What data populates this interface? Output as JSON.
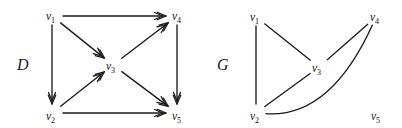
{
  "figure": {
    "width": 402,
    "height": 128,
    "background": "#ffffff",
    "ink_color": "#1a1a1a"
  },
  "graphs": [
    {
      "id": "D",
      "name_label": "D",
      "kind": "directed",
      "name_pos": {
        "x": 17,
        "y": 70
      },
      "vertices": [
        {
          "id": "v1",
          "base": "v",
          "sub": "1",
          "label": "v1",
          "label_x": 46,
          "label_y": 20,
          "node_x": 52,
          "node_y": 16
        },
        {
          "id": "v2",
          "base": "v",
          "sub": "2",
          "label": "v2",
          "label_x": 46,
          "label_y": 120,
          "node_x": 52,
          "node_y": 113
        },
        {
          "id": "v3",
          "base": "v",
          "sub": "3",
          "label": "v3",
          "label_x": 106,
          "label_y": 70,
          "node_x": 113,
          "node_y": 65
        },
        {
          "id": "v4",
          "base": "v",
          "sub": "4",
          "label": "v4",
          "label_x": 172,
          "label_y": 20,
          "node_x": 177,
          "node_y": 16
        },
        {
          "id": "v5",
          "base": "v",
          "sub": "5",
          "label": "v5",
          "label_x": 172,
          "label_y": 120,
          "node_x": 177,
          "node_y": 113
        }
      ],
      "edges": [
        {
          "from": "v1",
          "to": "v4",
          "directed": true,
          "shape": "line"
        },
        {
          "from": "v1",
          "to": "v2",
          "directed": true,
          "shape": "line"
        },
        {
          "from": "v1",
          "to": "v3",
          "directed": true,
          "shape": "line"
        },
        {
          "from": "v2",
          "to": "v3",
          "directed": true,
          "shape": "line"
        },
        {
          "from": "v2",
          "to": "v5",
          "directed": true,
          "shape": "line"
        },
        {
          "from": "v3",
          "to": "v4",
          "directed": true,
          "shape": "line"
        },
        {
          "from": "v3",
          "to": "v5",
          "directed": true,
          "shape": "line"
        },
        {
          "from": "v4",
          "to": "v5",
          "directed": true,
          "shape": "line"
        }
      ]
    },
    {
      "id": "G",
      "name_label": "G",
      "kind": "undirected",
      "name_pos": {
        "x": 217,
        "y": 70
      },
      "vertices": [
        {
          "id": "v1",
          "base": "v",
          "sub": "1",
          "label": "v1",
          "label_x": 250,
          "label_y": 21,
          "node_x": 256,
          "node_y": 17
        },
        {
          "id": "v2",
          "base": "v",
          "sub": "2",
          "label": "v2",
          "label_x": 250,
          "label_y": 120,
          "node_x": 256,
          "node_y": 113
        },
        {
          "id": "v3",
          "base": "v",
          "sub": "3",
          "label": "v3",
          "label_x": 312,
          "label_y": 72,
          "node_x": 319,
          "node_y": 67
        },
        {
          "id": "v4",
          "base": "v",
          "sub": "4",
          "label": "v4",
          "label_x": 370,
          "label_y": 21,
          "node_x": 376,
          "node_y": 17
        },
        {
          "id": "v5",
          "base": "v",
          "sub": "5",
          "label": "v5",
          "label_x": 371,
          "label_y": 120,
          "node_x": 377,
          "node_y": 113
        }
      ],
      "edges": [
        {
          "from": "v1",
          "to": "v2",
          "directed": false,
          "shape": "line"
        },
        {
          "from": "v1",
          "to": "v3",
          "directed": false,
          "shape": "line"
        },
        {
          "from": "v2",
          "to": "v3",
          "directed": false,
          "shape": "line"
        },
        {
          "from": "v3",
          "to": "v4",
          "directed": false,
          "shape": "line"
        },
        {
          "from": "v2",
          "to": "v4",
          "directed": false,
          "shape": "curve",
          "curve_control": {
            "x": 330,
            "y": 118
          }
        }
      ],
      "isolated_vertices": [
        "v5"
      ]
    }
  ]
}
